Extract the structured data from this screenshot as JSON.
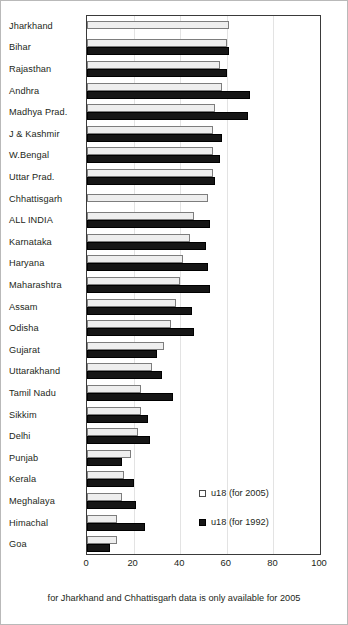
{
  "chart_data": {
    "type": "bar",
    "orientation": "horizontal",
    "title": "",
    "xlabel": "",
    "ylabel": "",
    "xlim": [
      0,
      100
    ],
    "xticks": [
      0,
      20,
      40,
      60,
      80,
      100
    ],
    "grid": true,
    "legend_position": "inside-right-lower",
    "categories": [
      "Jharkhand",
      "Bihar",
      "Rajasthan",
      "Andhra",
      "Madhya Prad.",
      "J & Kashmir",
      "W.Bengal",
      "Uttar Prad.",
      "Chhattisgarh",
      "ALL INDIA",
      "Karnataka",
      "Haryana",
      "Maharashtra",
      "Assam",
      "Odisha",
      "Gujarat",
      "Uttarakhand",
      "Tamil Nadu",
      "Sikkim",
      "Delhi",
      "Punjab",
      "Kerala",
      "Meghalaya",
      "Himachal",
      "Goa"
    ],
    "series": [
      {
        "name": "u18 (for 2005)",
        "color": "#eeeeee",
        "values": [
          61,
          60,
          57,
          58,
          55,
          54,
          54,
          54,
          52,
          46,
          44,
          41,
          40,
          38,
          36,
          33,
          28,
          23,
          23,
          22,
          19,
          16,
          15,
          13,
          13
        ]
      },
      {
        "name": "u18 (for 1992)",
        "color": "#161616",
        "values": [
          null,
          61,
          60,
          70,
          69,
          58,
          57,
          55,
          null,
          53,
          51,
          52,
          53,
          45,
          46,
          30,
          32,
          37,
          26,
          27,
          15,
          20,
          21,
          25,
          10
        ]
      }
    ],
    "annotations": [
      "for Jharkhand and Chhattisgarh data is only available for 2005"
    ]
  },
  "legend": {
    "items": [
      {
        "label": "u18 (for 2005)",
        "swatch": "open-square"
      },
      {
        "label": "u18 (for 1992)",
        "swatch": "filled-square"
      }
    ]
  },
  "footnote": {
    "text": "for Jharkhand and Chhattisgarh data is only available for 2005"
  }
}
